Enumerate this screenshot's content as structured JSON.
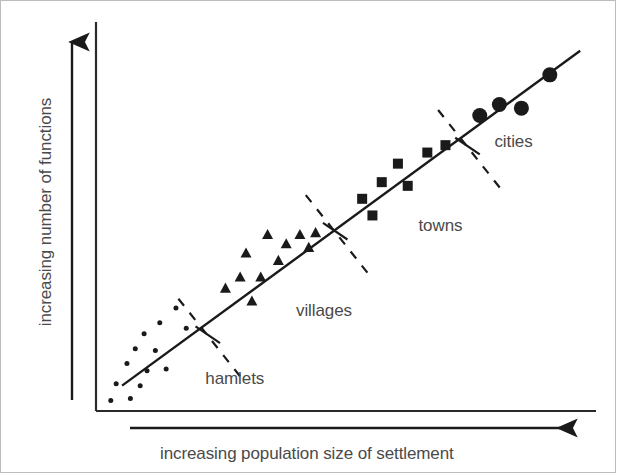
{
  "figure": {
    "type": "settlement-hierarchy-scatter",
    "background_color": "#ffffff",
    "border_color": "#bcbcbc",
    "ink_color": "#1a1a1a",
    "text_color": "#4a4a4a"
  },
  "axes": {
    "y_label": "increasing number of functions",
    "x_label": "increasing population size of settlement",
    "y_axis_arrow": "arrow-up-icon",
    "x_axis_arrow": "arrow-right-icon"
  },
  "group_labels": {
    "hamlets": "hamlets",
    "villages": "villages",
    "towns": "towns",
    "cities": "cities"
  },
  "chart_data": {
    "type": "scatter",
    "title": "",
    "xlabel": "increasing population size of settlement",
    "ylabel": "increasing number of functions",
    "xlim": [
      0,
      100
    ],
    "ylim": [
      0,
      100
    ],
    "grid": false,
    "legend_position": "inline-annotations",
    "axis_ticks": "none",
    "trend_line": {
      "label": "settlement hierarchy trend",
      "x_start": 4.5,
      "y_start": 5.5,
      "x_end": 98.0,
      "y_end": 96.0,
      "style": "solid"
    },
    "dividers": [
      {
        "name": "hamlets-villages-divider",
        "x1": 16.0,
        "y1": 29.0,
        "x2": 29.5,
        "y2": 6.5,
        "style": "dashed"
      },
      {
        "name": "villages-towns-divider",
        "x1": 42.0,
        "y1": 57.0,
        "x2": 55.5,
        "y2": 34.5,
        "style": "dashed"
      },
      {
        "name": "towns-cities-divider",
        "x1": 69.0,
        "y1": 80.0,
        "x2": 82.5,
        "y2": 57.5,
        "style": "dashed"
      },
      {
        "name": "divider-tick-hamlets",
        "x1": 19.5,
        "y1": 21.5,
        "x2": 24.5,
        "y2": 17.0,
        "style": "solid"
      },
      {
        "name": "divider-tick-villages",
        "x1": 45.5,
        "y1": 49.5,
        "x2": 50.5,
        "y2": 45.0,
        "style": "solid"
      },
      {
        "name": "divider-tick-towns",
        "x1": 72.5,
        "y1": 72.5,
        "x2": 77.5,
        "y2": 68.0,
        "style": "solid"
      }
    ],
    "series": [
      {
        "name": "hamlets",
        "marker": "circle-small",
        "marker_size": 5,
        "count": 13,
        "label_x": 21.5,
        "label_y": 7.0,
        "points": [
          {
            "x": 2.2,
            "y": 1.5
          },
          {
            "x": 3.3,
            "y": 6.0
          },
          {
            "x": 5.5,
            "y": 11.5
          },
          {
            "x": 6.2,
            "y": 2.0
          },
          {
            "x": 7.2,
            "y": 15.5
          },
          {
            "x": 8.2,
            "y": 5.5
          },
          {
            "x": 9.0,
            "y": 19.5
          },
          {
            "x": 9.6,
            "y": 9.5
          },
          {
            "x": 11.3,
            "y": 15.0
          },
          {
            "x": 12.2,
            "y": 22.5
          },
          {
            "x": 13.5,
            "y": 10.0
          },
          {
            "x": 15.5,
            "y": 26.5
          },
          {
            "x": 17.6,
            "y": 21.0
          }
        ]
      },
      {
        "name": "villages",
        "marker": "triangle",
        "marker_size": 11,
        "count": 11,
        "label_x": 40.0,
        "label_y": 25.5,
        "points": [
          {
            "x": 25.6,
            "y": 32.0
          },
          {
            "x": 28.6,
            "y": 35.0
          },
          {
            "x": 29.8,
            "y": 41.5
          },
          {
            "x": 31.0,
            "y": 28.5
          },
          {
            "x": 32.8,
            "y": 35.0
          },
          {
            "x": 34.2,
            "y": 46.5
          },
          {
            "x": 36.4,
            "y": 39.5
          },
          {
            "x": 38.0,
            "y": 44.0
          },
          {
            "x": 40.8,
            "y": 46.5
          },
          {
            "x": 42.6,
            "y": 43.0
          },
          {
            "x": 44.0,
            "y": 47.0
          }
        ]
      },
      {
        "name": "towns",
        "marker": "square",
        "marker_size": 10,
        "count": 6,
        "label_x": 65.0,
        "label_y": 48.5,
        "points": [
          {
            "x": 53.5,
            "y": 56.0
          },
          {
            "x": 55.6,
            "y": 51.5
          },
          {
            "x": 57.5,
            "y": 60.5
          },
          {
            "x": 60.8,
            "y": 65.5
          },
          {
            "x": 62.8,
            "y": 59.5
          },
          {
            "x": 66.8,
            "y": 68.5
          },
          {
            "x": 70.5,
            "y": 70.5
          }
        ]
      },
      {
        "name": "cities",
        "marker": "circle-large",
        "marker_size": 15,
        "count": 4,
        "label_x": 80.5,
        "label_y": 71.0,
        "points": [
          {
            "x": 77.5,
            "y": 78.5
          },
          {
            "x": 81.5,
            "y": 81.5
          },
          {
            "x": 86.0,
            "y": 80.5
          },
          {
            "x": 91.8,
            "y": 89.5
          }
        ]
      }
    ]
  }
}
